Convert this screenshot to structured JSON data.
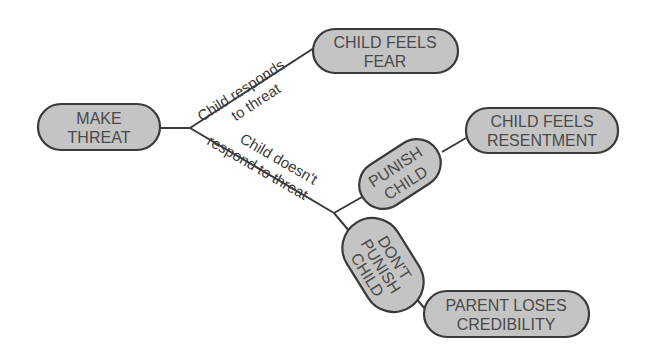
{
  "diagram": {
    "type": "decision-tree",
    "nodes": {
      "make_threat": {
        "line1": "MAKE",
        "line2": "THREAT"
      },
      "fear": {
        "line1": "CHILD FEELS",
        "line2": "FEAR"
      },
      "punish": {
        "line1": "PUNISH",
        "line2": "CHILD"
      },
      "resentment": {
        "line1": "CHILD FEELS",
        "line2": "RESENTMENT"
      },
      "dont_punish": {
        "line1": "DON'T",
        "line2": "PUNISH",
        "line3": "CHILD"
      },
      "credibility": {
        "line1": "PARENT LOSES",
        "line2": "CREDIBILITY"
      }
    },
    "edges": {
      "responds": {
        "line1": "Child responds",
        "line2": "to threat"
      },
      "not_respond": {
        "line1": "Child doesn't",
        "line2": "respond to threat"
      }
    },
    "colors": {
      "node_fill": "#c4c4c4",
      "stroke": "#3a3a3a",
      "text": "#4a4a4a"
    }
  }
}
